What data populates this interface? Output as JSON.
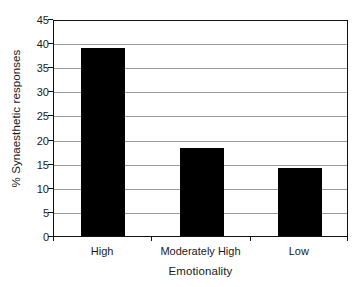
{
  "chart_data": {
    "type": "bar",
    "title": "",
    "subtitle": "",
    "xlabel": "Emotionality",
    "ylabel": "% Synaesthetic responses",
    "categories": [
      "High",
      "Moderately High",
      "Low"
    ],
    "values": [
      39.0,
      18.3,
      14.1
    ],
    "series": [
      {
        "name": "% Synaesthetic responses",
        "values": [
          39.0,
          18.3,
          14.1
        ]
      }
    ],
    "ylim": [
      0,
      45
    ],
    "ytick_labels": [
      "0",
      "5",
      "10",
      "15",
      "20",
      "25",
      "30",
      "35",
      "40",
      "45"
    ],
    "ytick_values": [
      0,
      5,
      10,
      15,
      20,
      25,
      30,
      35,
      40,
      45
    ],
    "ytick_interval": 5,
    "grid": "horizontal",
    "legend": "none",
    "bar_color": "#000000",
    "gridline_color": "#9a9a9a",
    "axis_color": "#111111",
    "background_color": "#ffffff",
    "annotations": []
  }
}
